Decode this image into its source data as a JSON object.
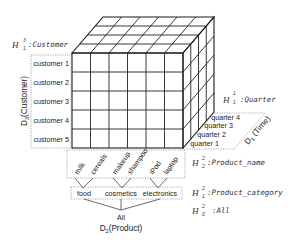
{
  "diagram": {
    "type": "olap-data-cube",
    "cube": {
      "columns": 6,
      "rows": 5,
      "depth": 4
    },
    "dimensions": {
      "customer": {
        "axis_label": "D",
        "axis_sub": "3",
        "axis_name": "(Customer)",
        "members": [
          "customer 1",
          "customer 2",
          "customer 3",
          "customer 4",
          "customer 5"
        ],
        "hierarchy": {
          "H": "H",
          "sup": "3",
          "sub": "1",
          "label": ":Customer"
        }
      },
      "time": {
        "axis_label": "D",
        "axis_sub": "1",
        "axis_name": " (Time)",
        "members": [
          "quarter 4",
          "quarter 3",
          "quarter 2",
          "quarter 1"
        ],
        "hierarchy": {
          "H": "H",
          "sup": "1",
          "sub": "1",
          "label": ":Quarter"
        }
      },
      "product": {
        "axis_label": "D",
        "axis_sub": "2",
        "axis_name": "(Product)",
        "members": [
          "milk",
          "cereals",
          "makeup",
          "shampoo",
          "iPod",
          "laptop"
        ],
        "categories": [
          "food",
          "cosmetics",
          "electronics"
        ],
        "root": "All",
        "hierarchies": [
          {
            "H": "H",
            "sup": "2",
            "sub": "2",
            "label": ":Product_name"
          },
          {
            "H": "H",
            "sup": "2",
            "sub": "1",
            "label": ":Product_category"
          },
          {
            "H": "H",
            "sup": "2",
            "sub": "0",
            "label": ":All"
          }
        ]
      }
    },
    "colors": {
      "lines": "#1a1a1a",
      "dotted_boxes": "#888888",
      "text": "#222222"
    }
  }
}
